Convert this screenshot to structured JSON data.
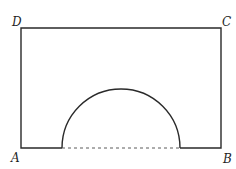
{
  "figure": {
    "labels": {
      "top_left": "D",
      "top_right": "C",
      "bottom_left": "A",
      "bottom_right": "B"
    },
    "colors": {
      "stroke": "#2a2a2a",
      "dash": "#5a5a5a",
      "background": "#ffffff"
    }
  }
}
